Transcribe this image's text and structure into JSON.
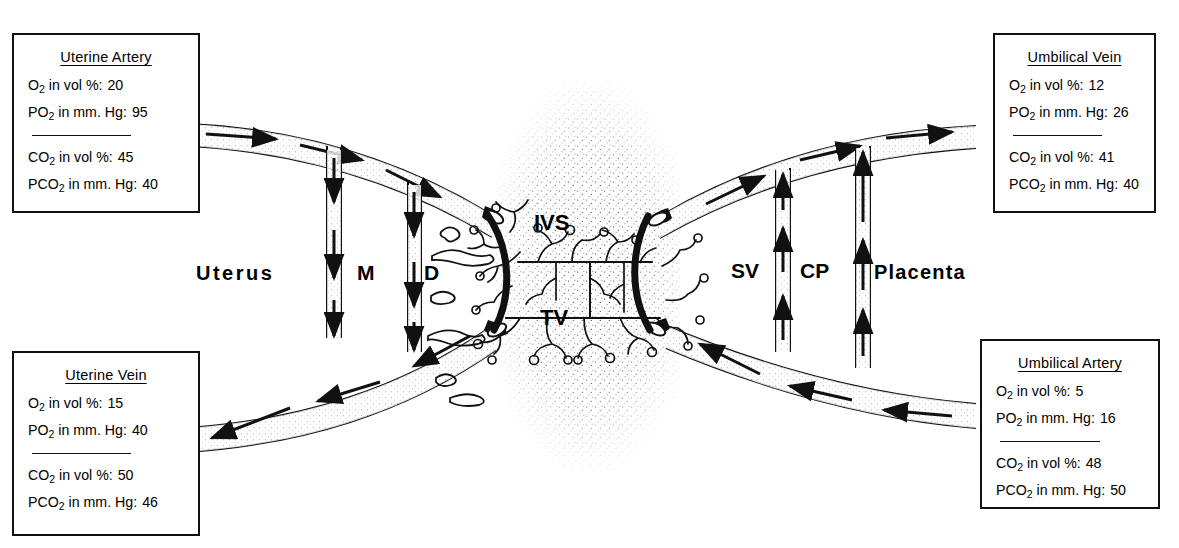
{
  "boxes": {
    "uterine_artery": {
      "title": "Uterine Artery",
      "rows": [
        {
          "species": "O",
          "sub": "2",
          "text": "in vol %:",
          "value": "20"
        },
        {
          "species": "PO",
          "sub": "2",
          "text": "in mm. Hg:",
          "value": "95"
        },
        {
          "species": "CO",
          "sub": "2",
          "text": "in vol %:",
          "value": "45"
        },
        {
          "species": "PCO",
          "sub": "2",
          "text": "in mm. Hg:",
          "value": "40"
        }
      ]
    },
    "uterine_vein": {
      "title": "Uterine Vein",
      "rows": [
        {
          "species": "O",
          "sub": "2",
          "text": "in vol %:",
          "value": "15"
        },
        {
          "species": "PO",
          "sub": "2",
          "text": "in mm. Hg:",
          "value": "40"
        },
        {
          "species": "CO",
          "sub": "2",
          "text": "in vol %:",
          "value": "50"
        },
        {
          "species": "PCO",
          "sub": "2",
          "text": "in mm. Hg:",
          "value": "46"
        }
      ]
    },
    "umbilical_vein": {
      "title": "Umbilical Vein",
      "rows": [
        {
          "species": "O",
          "sub": "2",
          "text": "in vol %:",
          "value": "12"
        },
        {
          "species": "PO",
          "sub": "2",
          "text": "in mm. Hg:",
          "value": "26"
        },
        {
          "species": "CO",
          "sub": "2",
          "text": "in vol %:",
          "value": "41"
        },
        {
          "species": "PCO",
          "sub": "2",
          "text": "in mm. Hg:",
          "value": "40"
        }
      ]
    },
    "umbilical_artery": {
      "title": "Umbilical Artery",
      "rows": [
        {
          "species": "O",
          "sub": "2",
          "text": "in vol %:",
          "value": "5"
        },
        {
          "species": "PO",
          "sub": "2",
          "text": "in mm. Hg:",
          "value": "16"
        },
        {
          "species": "CO",
          "sub": "2",
          "text": "in vol %:",
          "value": "48"
        },
        {
          "species": "PCO",
          "sub": "2",
          "text": "in mm. Hg:",
          "value": "50"
        }
      ]
    }
  },
  "labels": {
    "uterus": "Uterus",
    "myometrium": "M",
    "decidua": "D",
    "intervillous_space": "IVS",
    "terminal_villi": "TV",
    "subchorial_space": "SV",
    "chorionic_plate": "CP",
    "placenta": "Placenta"
  },
  "colors": {
    "ink": "#111111",
    "paper": "#ffffff",
    "stipple": "#3a3a3a"
  }
}
